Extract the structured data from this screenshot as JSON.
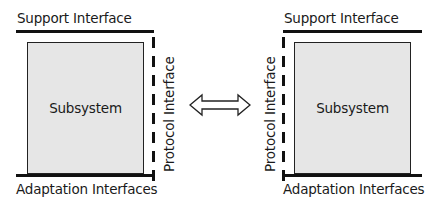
{
  "diagram": {
    "left": {
      "top_label": "Support Interface",
      "box_label": "Subsystem",
      "side_label": "Protocol Interface",
      "bottom_label": "Adaptation Interfaces"
    },
    "right": {
      "top_label": "Support Interface",
      "box_label": "Subsystem",
      "side_label": "Protocol Interface",
      "bottom_label": "Adaptation Interfaces"
    },
    "connector": "double-arrow-icon",
    "colors": {
      "box_fill": "#e6e6e6",
      "lines": "#111111"
    }
  }
}
